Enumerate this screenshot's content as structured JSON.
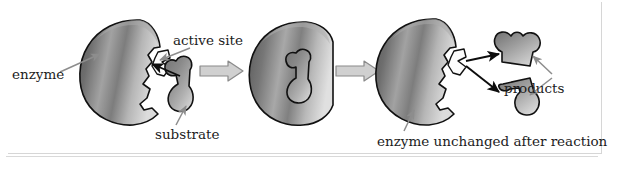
{
  "figure": {
    "background_color": "#ffffff",
    "frame_color": "#d6d6d6",
    "rule_color": "#d9d9d9"
  },
  "labels": {
    "enzyme": "enzyme",
    "active_site": "active site",
    "substrate": "substrate",
    "products": "products",
    "enzyme_unchanged": "enzyme unchanged after reaction"
  },
  "stages": [
    {
      "name": "stage-1-enzyme-and-substrate",
      "caption_labels": [
        "enzyme",
        "active site",
        "substrate"
      ]
    },
    {
      "name": "stage-2-enzyme-substrate-complex",
      "caption_labels": []
    },
    {
      "name": "stage-3-enzyme-and-products",
      "caption_labels": [
        "products",
        "enzyme unchanged after reaction"
      ]
    }
  ],
  "colors": {
    "enzyme_fill_dark": "#5f5f5f",
    "enzyme_fill_light": "#d8d8d8",
    "enzyme_outline": "#111111",
    "substrate_fill_dark": "#6a6a6a",
    "substrate_fill_light": "#cfcfcf",
    "leader_line": "#8d8d8d",
    "black_arrow": "#0d0d0d",
    "block_arrow_fill": "#d0d0d0",
    "block_arrow_outline": "#8a8a8a",
    "text": "#1c1c1c"
  },
  "transition_arrows": [
    {
      "name": "arrow-stage1-to-stage2",
      "style": "hollow-block-arrow",
      "direction": "right"
    },
    {
      "name": "arrow-stage2-to-stage3",
      "style": "hollow-block-arrow",
      "direction": "right"
    }
  ],
  "binding_arrows": [
    {
      "name": "substrate-binding-arrow",
      "style": "solid-black-arrow",
      "direction": "left"
    }
  ],
  "product_arrows": [
    {
      "name": "product-release-arrow-upper",
      "style": "solid-black-arrow",
      "direction": "upper-right"
    },
    {
      "name": "product-release-arrow-lower",
      "style": "solid-black-arrow",
      "direction": "lower-right"
    }
  ]
}
